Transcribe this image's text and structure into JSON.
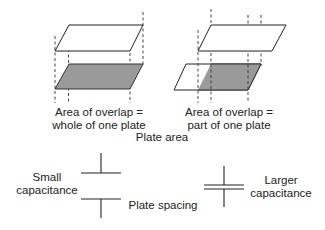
{
  "figure": {
    "type": "diagram"
  },
  "plate_area": {
    "caption": "Plate area",
    "panels": [
      {
        "id": "full-overlap",
        "label_line1": "Area of overlap =",
        "label_line2": "whole of one plate"
      },
      {
        "id": "partial-overlap",
        "label_line1": "Area of overlap =",
        "label_line2": "part of one plate"
      }
    ]
  },
  "plate_spacing": {
    "caption": "Plate spacing",
    "small": {
      "label_line1": "Small",
      "label_line2": "capacitance"
    },
    "large": {
      "label_line1": "Larger",
      "label_line2": "capacitance"
    }
  },
  "colors": {
    "line": "#2a2a2a",
    "overlap_fill": "#9a9a9a",
    "dashed": "#333333",
    "background": "#ffffff"
  }
}
